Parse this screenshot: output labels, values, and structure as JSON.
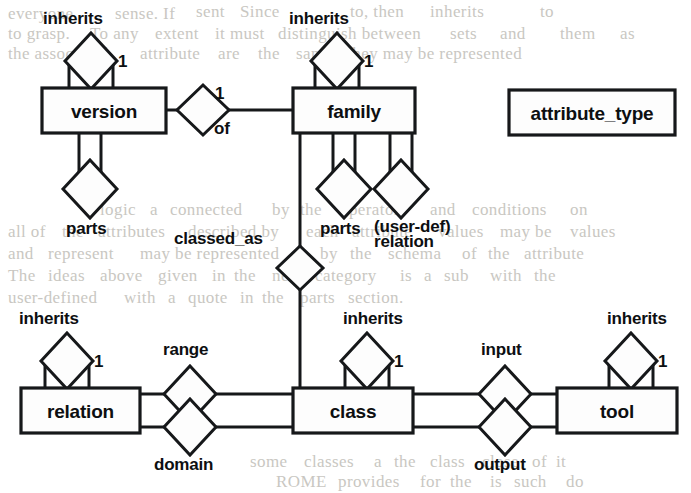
{
  "diagram": {
    "type": "er-diagram",
    "entities": [
      {
        "id": "version",
        "label": "version",
        "x": 42,
        "y": 88,
        "w": 124,
        "h": 45
      },
      {
        "id": "family",
        "label": "family",
        "x": 293,
        "y": 88,
        "w": 122,
        "h": 45
      },
      {
        "id": "attribute_type",
        "label": "attribute_type",
        "x": 509,
        "y": 90,
        "w": 166,
        "h": 45
      },
      {
        "id": "relation",
        "label": "relation",
        "x": 21,
        "y": 388,
        "w": 119,
        "h": 45
      },
      {
        "id": "class",
        "label": "class",
        "x": 293,
        "y": 388,
        "w": 120,
        "h": 45
      },
      {
        "id": "tool",
        "label": "tool",
        "x": 557,
        "y": 388,
        "w": 120,
        "h": 45
      }
    ],
    "relationships": [
      {
        "id": "version-inherits",
        "label": "inherits",
        "cardinality": "1",
        "from": "version",
        "to": "version",
        "kind": "self-loop-top"
      },
      {
        "id": "family-inherits",
        "label": "inherits",
        "cardinality": "1",
        "from": "family",
        "to": "family",
        "kind": "self-loop-top"
      },
      {
        "id": "relation-inherits",
        "label": "inherits",
        "cardinality": "1",
        "from": "relation",
        "to": "relation",
        "kind": "self-loop-top"
      },
      {
        "id": "class-inherits",
        "label": "inherits",
        "cardinality": "1",
        "from": "class",
        "to": "class",
        "kind": "self-loop-top"
      },
      {
        "id": "tool-inherits",
        "label": "inherits",
        "cardinality": "1",
        "from": "tool",
        "to": "tool",
        "kind": "self-loop-top"
      },
      {
        "id": "version-parts",
        "label": "parts",
        "cardinality": "",
        "from": "version",
        "to": "version",
        "kind": "self-loop-bottom"
      },
      {
        "id": "family-parts",
        "label": "parts",
        "cardinality": "",
        "from": "family",
        "to": "family",
        "kind": "self-loop-bottom"
      },
      {
        "id": "version-of-family",
        "label": "of",
        "cardinality": "1",
        "from": "version",
        "to": "family",
        "kind": "horizontal"
      },
      {
        "id": "family-userdef-relation",
        "label_line1": "(user-def)",
        "label_line2": "relation",
        "from": "family",
        "to": "family",
        "kind": "self-loop-bottom"
      },
      {
        "id": "family-classed-as",
        "label": "classed_as",
        "cardinality": "",
        "from": "family",
        "to": "class",
        "kind": "vertical"
      },
      {
        "id": "relation-range",
        "label": "range",
        "cardinality": "",
        "from": "relation",
        "to": "class",
        "kind": "horizontal-upper"
      },
      {
        "id": "relation-domain",
        "label": "domain",
        "cardinality": "",
        "from": "relation",
        "to": "class",
        "kind": "horizontal-lower"
      },
      {
        "id": "class-input-tool",
        "label": "input",
        "cardinality": "",
        "from": "class",
        "to": "tool",
        "kind": "horizontal-upper"
      },
      {
        "id": "class-output-tool",
        "label": "output",
        "cardinality": "",
        "from": "class",
        "to": "tool",
        "kind": "horizontal-lower"
      }
    ],
    "labels": {
      "inherits": "inherits",
      "parts": "parts",
      "of": "of",
      "one": "1",
      "classed_as": "classed_as",
      "userdef_line1": "(user-def)",
      "userdef_line2": "relation",
      "range": "range",
      "domain": "domain",
      "input": "input",
      "output": "output"
    },
    "colors": {
      "ink": "#16181a",
      "paper": "#ffffff",
      "box_fill": "#fdfdfd",
      "bleed_text": "#c9c7c2"
    }
  },
  "page_bleed_text": {
    "lines": [
      {
        "text": "everyone",
        "x": 8,
        "y": 4
      },
      {
        "text": "sense. If",
        "x": 115,
        "y": 4
      },
      {
        "text": "sent",
        "x": 196,
        "y": 2
      },
      {
        "text": "Since",
        "x": 240,
        "y": 2
      },
      {
        "text": "to, then",
        "x": 350,
        "y": 2
      },
      {
        "text": "inherits",
        "x": 430,
        "y": 2
      },
      {
        "text": "to",
        "x": 540,
        "y": 2
      },
      {
        "text": "to grasp.",
        "x": 8,
        "y": 24
      },
      {
        "text": "To any",
        "x": 90,
        "y": 24
      },
      {
        "text": "extent",
        "x": 155,
        "y": 24
      },
      {
        "text": "it must",
        "x": 215,
        "y": 24
      },
      {
        "text": "distinguish between",
        "x": 278,
        "y": 24
      },
      {
        "text": "sets",
        "x": 450,
        "y": 24
      },
      {
        "text": "and",
        "x": 500,
        "y": 24
      },
      {
        "text": "them",
        "x": 560,
        "y": 24
      },
      {
        "text": "as",
        "x": 620,
        "y": 24
      },
      {
        "text": "the associated",
        "x": 8,
        "y": 44
      },
      {
        "text": "attribute",
        "x": 140,
        "y": 44
      },
      {
        "text": "are",
        "x": 218,
        "y": 44
      },
      {
        "text": "the",
        "x": 258,
        "y": 44
      },
      {
        "text": "same. They may be represented",
        "x": 296,
        "y": 44
      },
      {
        "text": "logic",
        "x": 100,
        "y": 200
      },
      {
        "text": "a",
        "x": 150,
        "y": 200
      },
      {
        "text": "connected",
        "x": 170,
        "y": 200
      },
      {
        "text": "by",
        "x": 272,
        "y": 200
      },
      {
        "text": "the",
        "x": 300,
        "y": 200
      },
      {
        "text": "operators",
        "x": 340,
        "y": 200
      },
      {
        "text": "and",
        "x": 430,
        "y": 200
      },
      {
        "text": "conditions",
        "x": 472,
        "y": 200
      },
      {
        "text": "on",
        "x": 570,
        "y": 200
      },
      {
        "text": "all of",
        "x": 8,
        "y": 222
      },
      {
        "text": "the",
        "x": 62,
        "y": 222
      },
      {
        "text": "attributes",
        "x": 98,
        "y": 222
      },
      {
        "text": "described by",
        "x": 188,
        "y": 222
      },
      {
        "text": "each",
        "x": 306,
        "y": 222
      },
      {
        "text": "attribute",
        "x": 352,
        "y": 222
      },
      {
        "text": "values",
        "x": 438,
        "y": 222
      },
      {
        "text": "may be",
        "x": 500,
        "y": 222
      },
      {
        "text": "values",
        "x": 570,
        "y": 222
      },
      {
        "text": "and",
        "x": 8,
        "y": 244
      },
      {
        "text": "represent",
        "x": 48,
        "y": 244
      },
      {
        "text": "may be represented",
        "x": 140,
        "y": 244
      },
      {
        "text": "by",
        "x": 320,
        "y": 244
      },
      {
        "text": "the",
        "x": 350,
        "y": 244
      },
      {
        "text": "schema",
        "x": 388,
        "y": 244
      },
      {
        "text": "of",
        "x": 462,
        "y": 244
      },
      {
        "text": "the",
        "x": 488,
        "y": 244
      },
      {
        "text": "attribute",
        "x": 524,
        "y": 244
      },
      {
        "text": "The",
        "x": 8,
        "y": 266
      },
      {
        "text": "ideas",
        "x": 48,
        "y": 266
      },
      {
        "text": "above",
        "x": 100,
        "y": 266
      },
      {
        "text": "given",
        "x": 158,
        "y": 266
      },
      {
        "text": "in",
        "x": 212,
        "y": 266
      },
      {
        "text": "the",
        "x": 234,
        "y": 266
      },
      {
        "text": "next",
        "x": 272,
        "y": 266
      },
      {
        "text": "category",
        "x": 315,
        "y": 266
      },
      {
        "text": "is",
        "x": 400,
        "y": 266
      },
      {
        "text": "a",
        "x": 424,
        "y": 266
      },
      {
        "text": "sub",
        "x": 444,
        "y": 266
      },
      {
        "text": "with",
        "x": 490,
        "y": 266
      },
      {
        "text": "the",
        "x": 534,
        "y": 266
      },
      {
        "text": "user-defined",
        "x": 8,
        "y": 288
      },
      {
        "text": "with",
        "x": 124,
        "y": 288
      },
      {
        "text": "a",
        "x": 168,
        "y": 288
      },
      {
        "text": "quote",
        "x": 188,
        "y": 288
      },
      {
        "text": "in",
        "x": 240,
        "y": 288
      },
      {
        "text": "the",
        "x": 262,
        "y": 288
      },
      {
        "text": "parts",
        "x": 300,
        "y": 288
      },
      {
        "text": "section.",
        "x": 348,
        "y": 288
      },
      {
        "text": "some",
        "x": 250,
        "y": 452
      },
      {
        "text": "classes",
        "x": 304,
        "y": 452
      },
      {
        "text": "a",
        "x": 374,
        "y": 452
      },
      {
        "text": "the",
        "x": 394,
        "y": 452
      },
      {
        "text": "class",
        "x": 430,
        "y": 452
      },
      {
        "text": "close",
        "x": 482,
        "y": 452
      },
      {
        "text": "of",
        "x": 532,
        "y": 452
      },
      {
        "text": "it",
        "x": 556,
        "y": 452
      },
      {
        "text": "ROME",
        "x": 276,
        "y": 472
      },
      {
        "text": "provides",
        "x": 338,
        "y": 472
      },
      {
        "text": "for",
        "x": 420,
        "y": 472
      },
      {
        "text": "the",
        "x": 450,
        "y": 472
      },
      {
        "text": "is",
        "x": 490,
        "y": 472
      },
      {
        "text": "such",
        "x": 514,
        "y": 472
      },
      {
        "text": "do",
        "x": 566,
        "y": 472
      }
    ]
  }
}
